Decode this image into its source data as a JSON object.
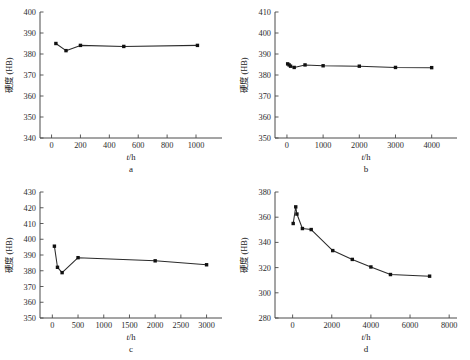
{
  "figure": {
    "panel_count": 4,
    "shared_xlabel": "t/h",
    "shared_ylabel": "硬度 (HB)",
    "ylabel_parts": {
      "cjk": "硬度",
      "unit": "(HB)"
    },
    "xlabel_parts": {
      "italic": "t",
      "rest": "/h"
    },
    "line_color": "#2b2b2b",
    "marker_color": "#111111",
    "axis_color": "#4a4a4a",
    "background": "#ffffff"
  },
  "chart_data": [
    {
      "type": "line",
      "panel": "a",
      "panel_label": "a",
      "title": "",
      "xlabel": "t/h",
      "ylabel": "硬度 (HB)",
      "xlim": [
        -80,
        1180
      ],
      "ylim": [
        340,
        400
      ],
      "xticks": [
        0,
        200,
        400,
        600,
        800,
        1000
      ],
      "yticks": [
        340,
        350,
        360,
        370,
        380,
        390,
        400
      ],
      "xticklabels": [
        "0",
        "200",
        "400",
        "600",
        "800",
        "1000"
      ],
      "yticklabels": [
        "340",
        "350",
        "360",
        "370",
        "380",
        "390",
        "400"
      ],
      "grid": false,
      "legend": "none",
      "x": [
        30,
        100,
        200,
        500,
        1010
      ],
      "values": [
        385.0,
        381.6,
        384.1,
        383.6,
        384.1
      ]
    },
    {
      "type": "line",
      "panel": "b",
      "panel_label": "b",
      "title": "",
      "xlabel": "t/h",
      "ylabel": "硬度 (HB)",
      "xlim": [
        -330,
        4700
      ],
      "ylim": [
        350,
        410
      ],
      "xticks": [
        0,
        1000,
        2000,
        3000,
        4000
      ],
      "yticks": [
        350,
        360,
        370,
        380,
        390,
        400,
        410
      ],
      "xticklabels": [
        "0",
        "1000",
        "2000",
        "3000",
        "4000"
      ],
      "yticklabels": [
        "350",
        "360",
        "370",
        "380",
        "390",
        "400",
        "410"
      ],
      "grid": false,
      "legend": "none",
      "x": [
        20,
        60,
        100,
        200,
        500,
        1000,
        2000,
        3000,
        4000
      ],
      "values": [
        385.3,
        384.8,
        384.2,
        383.6,
        384.8,
        384.4,
        384.2,
        383.6,
        383.5
      ]
    },
    {
      "type": "line",
      "panel": "c",
      "panel_label": "c",
      "title": "",
      "xlabel": "t/h",
      "ylabel": "硬度 (HB)",
      "xlim": [
        -240,
        3300
      ],
      "ylim": [
        350,
        430
      ],
      "xticks": [
        0,
        500,
        1000,
        1500,
        2000,
        2500,
        3000
      ],
      "yticks": [
        350,
        360,
        370,
        380,
        390,
        400,
        410,
        420,
        430
      ],
      "xticklabels": [
        "0",
        "500",
        "1000",
        "1500",
        "2000",
        "2500",
        "3000"
      ],
      "yticklabels": [
        "350",
        "360",
        "370",
        "380",
        "390",
        "400",
        "410",
        "420",
        "430"
      ],
      "grid": false,
      "legend": "none",
      "x": [
        40,
        100,
        190,
        500,
        2000,
        3000
      ],
      "values": [
        395.6,
        382.2,
        378.8,
        388.3,
        386.3,
        383.8
      ]
    },
    {
      "type": "line",
      "panel": "d",
      "panel_label": "d",
      "title": "",
      "xlabel": "t/h",
      "ylabel": "硬度 (HB)",
      "xlim": [
        -900,
        8400
      ],
      "ylim": [
        280,
        380
      ],
      "xticks": [
        0,
        2000,
        4000,
        6000,
        8000
      ],
      "yticks": [
        280,
        300,
        320,
        340,
        360,
        380
      ],
      "xticklabels": [
        "0",
        "2000",
        "4000",
        "6000",
        "8000"
      ],
      "yticklabels": [
        "280",
        "300",
        "320",
        "340",
        "360",
        "380"
      ],
      "grid": false,
      "legend": "none",
      "x": [
        30,
        160,
        220,
        500,
        950,
        2050,
        3050,
        4000,
        5000,
        7000
      ],
      "values": [
        355.0,
        368.2,
        362.5,
        351.0,
        350.2,
        333.5,
        326.5,
        320.5,
        314.5,
        313.2
      ]
    }
  ]
}
